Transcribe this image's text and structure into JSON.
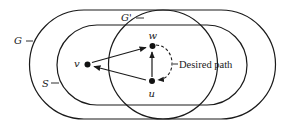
{
  "diagram": {
    "regions": [
      {
        "id": "G",
        "label": "G",
        "shape": "stadium"
      },
      {
        "id": "S",
        "label": "S",
        "shape": "stadium",
        "inside": "G"
      },
      {
        "id": "Gprime",
        "label": "G'",
        "shape": "circle"
      }
    ],
    "nodes": [
      {
        "id": "v",
        "label": "v"
      },
      {
        "id": "w",
        "label": "w"
      },
      {
        "id": "u",
        "label": "u"
      }
    ],
    "edges": [
      {
        "from": "v",
        "to": "w",
        "style": "solid"
      },
      {
        "from": "u",
        "to": "v",
        "style": "solid"
      },
      {
        "from": "u",
        "to": "w",
        "style": "solid"
      },
      {
        "from": "w",
        "to": "u",
        "style": "dashed",
        "label": "Desired path"
      }
    ],
    "annotation": "Desired path"
  }
}
